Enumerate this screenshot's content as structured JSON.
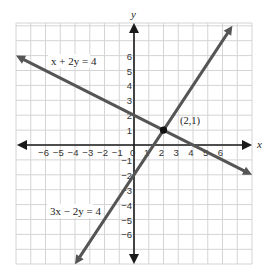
{
  "chart_data": {
    "type": "line",
    "title": "",
    "xlabel": "x",
    "ylabel": "y",
    "xlim": [
      -8,
      8
    ],
    "ylim": [
      -8,
      8
    ],
    "grid": true,
    "x_ticks": [
      "-6",
      "-5",
      "-4",
      "-3",
      "-2",
      "-1",
      "0",
      "1",
      "2",
      "3",
      "4",
      "5",
      "6"
    ],
    "y_ticks": [
      "6",
      "5",
      "4",
      "3",
      "2",
      "1",
      "-1",
      "-2",
      "-3",
      "-4",
      "-5",
      "-6"
    ],
    "series": [
      {
        "name": "x + 2y = 4",
        "equation": "x + 2y = 4",
        "points": [
          [
            -8,
            6
          ],
          [
            8,
            -2
          ]
        ],
        "color": "#555555"
      },
      {
        "name": "3x − 2y = 4",
        "equation": "3x − 2y = 4",
        "points": [
          [
            -4,
            -8
          ],
          [
            6.67,
            8
          ]
        ],
        "color": "#555555"
      }
    ],
    "annotations": [
      {
        "text": "(2,1)",
        "x": 2,
        "y": 1,
        "type": "intersection-point"
      }
    ]
  },
  "labels": {
    "x_axis": "x",
    "y_axis": "y",
    "eq1": "x + 2y = 4",
    "eq2": "3x − 2y = 4",
    "intersection": "(2,1)"
  },
  "colors": {
    "grid": "#d4d4d4",
    "axis": "#1a1a1a",
    "line": "#555555",
    "point": "#111111"
  }
}
